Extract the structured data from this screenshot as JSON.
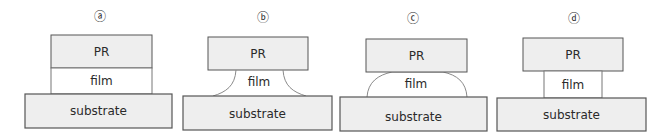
{
  "colors": {
    "box_fill": "#eeeeee",
    "film_fill": "#ffffff",
    "stroke": "#555555",
    "curve_stroke": "#8a8a8a",
    "text": "#2a2a2a"
  },
  "panels": [
    {
      "id": "a",
      "label": "ⓐ",
      "pr": "PR",
      "film": "film",
      "substrate": "substrate",
      "film_shape": "straight vertical sidewalls aligned with PR"
    },
    {
      "id": "b",
      "label": "ⓑ",
      "pr": "PR",
      "film": "film",
      "substrate": "substrate",
      "film_shape": "concave sidewalls (undercut), narrow at PR and flaring at substrate"
    },
    {
      "id": "c",
      "label": "ⓒ",
      "pr": "PR",
      "film": "film",
      "substrate": "substrate",
      "film_shape": "convex dome-shaped sidewalls"
    },
    {
      "id": "d",
      "label": "ⓓ",
      "pr": "PR",
      "film": "film",
      "substrate": "substrate",
      "film_shape": "straight vertical sidewalls, narrower than PR (undercut)"
    }
  ]
}
